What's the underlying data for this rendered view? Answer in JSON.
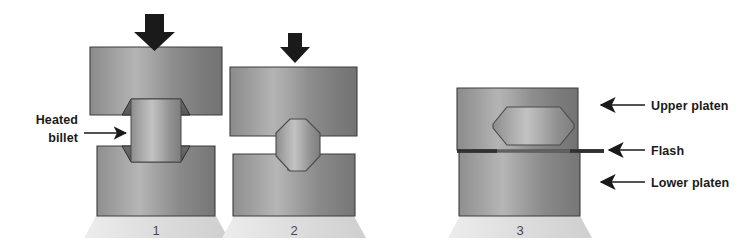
{
  "figure": {
    "background_color": "#ffffff",
    "stages": [
      {
        "number": "1",
        "caption_name": "stage-number-1",
        "description": "Heated billet placed between open upper and lower platens",
        "force_arrow": "downward-force-arrow",
        "workpiece": "cylindrical heated billet"
      },
      {
        "number": "2",
        "caption_name": "stage-number-2",
        "description": "Platens close and billet is upset into a barrel shape",
        "force_arrow": "downward-force-arrow",
        "workpiece": "partially deformed octagonal billet"
      },
      {
        "number": "3",
        "caption_name": "stage-number-3",
        "description": "Die cavity fully filled, excess metal extruded as flash",
        "force_arrow": null,
        "workpiece": "finished forging with flash"
      }
    ],
    "labels": {
      "heated_billet": {
        "line1": "Heated",
        "line2": "billet",
        "arrow_direction": "right",
        "points_to": "billet in stage 1"
      },
      "upper_platen": {
        "text": "Upper platen",
        "arrow_direction": "left",
        "points_to": "upper platen in stage 3"
      },
      "flash": {
        "text": "Flash",
        "arrow_direction": "left",
        "points_to": "flash at parting line in stage 3"
      },
      "lower_platen": {
        "text": "Lower platen",
        "arrow_direction": "left",
        "points_to": "lower platen in stage 3"
      }
    },
    "colors": {
      "platen_light": "#a8a8a8",
      "platen_mid": "#8f8f8f",
      "platen_dark": "#6e6e6e",
      "platen_edge": "#3d3d3d",
      "billet_light": "#bdbdbd",
      "billet_mid": "#9a9a9a",
      "billet_dark": "#757575",
      "base_light": "#e4e4e4",
      "base_dark": "#c9c9c9",
      "arrow_black": "#1a1a1a",
      "text_black": "#1a1a1a",
      "number_gray": "#4a4a4a",
      "background": "#ffffff"
    }
  }
}
